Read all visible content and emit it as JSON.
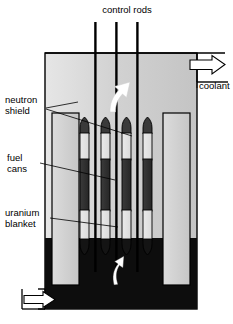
{
  "diagram": {
    "labels": {
      "control_rods": "control rods",
      "coolant": "coolant",
      "neutron_shield": "neutron\nshield",
      "neutron_shield_line1": "neutron",
      "neutron_shield_line2": "shield",
      "fuel_cans_line1": "fuel",
      "fuel_cans_line2": "cans",
      "uranium_blanket_line1": "uranium",
      "uranium_blanket_line2": "blanket"
    },
    "colors": {
      "background": "#ffffff",
      "outline": "#000000",
      "vessel_fill_light": "#d6d6d6",
      "shield_fill": "#cfcfcf",
      "blanket_fill": "#e4e4e4",
      "fuel_dark": "#2f2f2f",
      "coolant_pool_dark": "#0d0d0d",
      "arrow_white": "#ffffff",
      "rod_black": "#000000"
    },
    "counts": {
      "control_rods": 3,
      "fuel_columns": 4
    },
    "components": [
      {
        "name": "control-rods",
        "label": "control rods"
      },
      {
        "name": "coolant-outlet",
        "label": "coolant"
      },
      {
        "name": "neutron-shield",
        "label": "neutron shield"
      },
      {
        "name": "fuel-cans",
        "label": "fuel cans"
      },
      {
        "name": "uranium-blanket",
        "label": "uranium blanket"
      }
    ]
  }
}
